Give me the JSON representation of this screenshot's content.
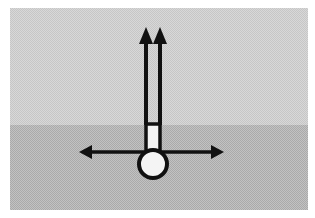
{
  "diagram": {
    "type": "force-diagram",
    "background": {
      "border_color": "#ffffff",
      "upper_region": {
        "color": "#d4d4d4",
        "x": 10,
        "y": 8,
        "width": 298,
        "height": 117
      },
      "lower_region": {
        "color": "#b9b9b9",
        "x": 10,
        "y": 125,
        "width": 298,
        "height": 85
      }
    },
    "stroke_color": "#111111",
    "fill_color": "#f4f4f4",
    "body": {
      "shape": "circle",
      "cx": 153,
      "cy": 164,
      "r": 14
    },
    "column": {
      "shape": "rectangle",
      "x": 146,
      "y": 125,
      "width": 14,
      "height": 27
    },
    "vertical_arrows": [
      {
        "x": 146,
        "y_start": 125,
        "y_end": 27,
        "direction": "up"
      },
      {
        "x": 160,
        "y_start": 125,
        "y_end": 27,
        "direction": "up"
      }
    ],
    "horizontal_arrow": {
      "y": 152,
      "x_start": 79,
      "x_end": 224,
      "direction": "both"
    }
  }
}
